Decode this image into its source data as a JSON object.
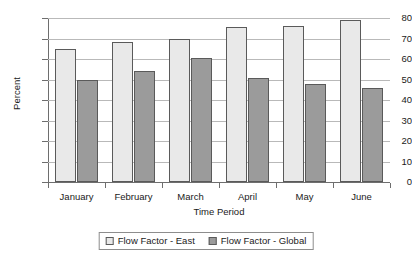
{
  "chart_data": {
    "type": "bar",
    "title": "",
    "subtitle": "",
    "xlabel": "Time Period",
    "ylabel": "Percent",
    "categories": [
      "January",
      "February",
      "March",
      "April",
      "May",
      "June"
    ],
    "series": [
      {
        "name": "Flow Factor - East",
        "color": "#e9e9e9",
        "values": [
          65,
          68.5,
          70,
          75.5,
          76,
          79
        ]
      },
      {
        "name": "Flow Factor - Global",
        "color": "#9b9b9b",
        "values": [
          50,
          54,
          60.5,
          50.5,
          48,
          46
        ]
      }
    ],
    "ylim": [
      0,
      80
    ],
    "ytick_step": 10,
    "yticks": [
      0,
      10,
      20,
      30,
      40,
      50,
      60,
      70,
      80
    ],
    "ytick_labels": [
      "0",
      "10",
      "20",
      "30",
      "40",
      "50",
      "60",
      "70",
      "80"
    ],
    "grid": true,
    "grid_axis": "y",
    "legend_position": "bottom-center",
    "orientation": "vertical",
    "grouping": "grouped",
    "background": "#ffffff",
    "axis_color": "#6e6e6e",
    "gridline_color": "#b9b9b9",
    "bar_border_color": "#5a5a5a"
  }
}
